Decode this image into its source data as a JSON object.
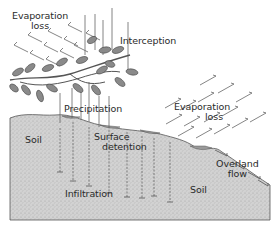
{
  "diagram": {
    "labels": {
      "evaporation_loss_top_line1": "Evaporation",
      "evaporation_loss_top_line2": "loss",
      "interception": "Interception",
      "precipitation": "Precipitation",
      "evaporation_loss_right_line1": "Evaporation",
      "evaporation_loss_right_line2": "loss",
      "surface_detention_line1": "Surface",
      "surface_detention_line2": "detention",
      "soil_left": "Soil",
      "soil_right": "Soil",
      "overland_flow_line1": "Overland",
      "overland_flow_line2": "flow",
      "infiltration": "Infiltration"
    },
    "colors": {
      "soil_fill": "#cfcfcf",
      "soil_stipple": "#9a9a9a",
      "line": "#555555",
      "leaf_fill": "#8a8a8a",
      "water_fill": "#9a9a9a",
      "text": "#2a2a2a"
    }
  }
}
